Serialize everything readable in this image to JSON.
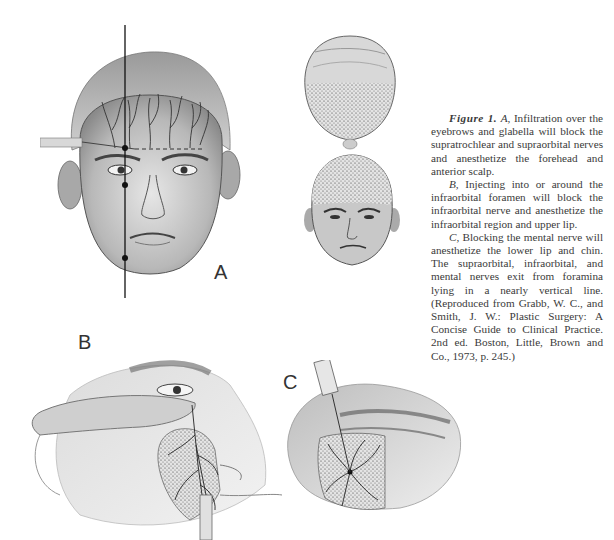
{
  "figure": {
    "panels": [
      {
        "id": "A",
        "label": "A",
        "description": "Frontal view of face with vertical line through supraorbital, infraorbital and mental foramina; needle infiltrating over eyebrows and glabella; nerve branches on forehead"
      },
      {
        "id": "top-view",
        "label": "",
        "description": "Top view of head showing stippled anesthetized scalp area"
      },
      {
        "id": "front-small",
        "label": "",
        "description": "Small frontal face showing stippled anesthetized forehead and anterior scalp"
      },
      {
        "id": "B",
        "label": "B",
        "description": "Finger retracting lower eyelid while needle injects near infraorbital foramen; stippled region over cheek and upper lip"
      },
      {
        "id": "C",
        "label": "C",
        "description": "Needle injecting mental nerve; stippled region over lower lip and chin"
      }
    ],
    "caption": {
      "figure_label": "Figure 1.",
      "paragraph_a_label": "A,",
      "paragraph_a_text": " Infiltration over the eyebrows and glabella will block the supratrochlear and supraorbital nerves and anesthetize the forehead and anterior scalp.",
      "paragraph_b_label": "B,",
      "paragraph_b_text": " Injecting into or around the infraorbital foramen will block the infraorbital nerve and anesthetize the infraorbital region and upper lip.",
      "paragraph_c_label": "C,",
      "paragraph_c_text": " Blocking the mental nerve will anesthetize the lower lip and chin. The supraorbital, infraorbital, and mental nerves exit from foramina lying in a nearly vertical line. (Reproduced from Grabb, W. C., and Smith, J. W.: Plastic Surgery: A Concise Guide to Clinical Practice. 2nd ed. Boston, Little, Brown and Co., 1973, p. 245.)"
    }
  }
}
